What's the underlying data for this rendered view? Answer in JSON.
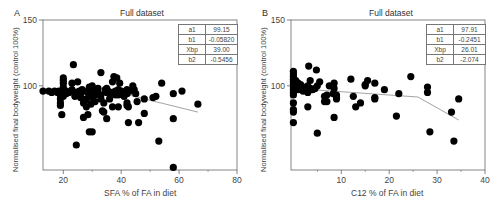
{
  "chart_data": [
    {
      "panel_label": "A",
      "type": "scatter",
      "title": "Full dataset",
      "xlabel": "SFA % of FA in diet",
      "ylabel": "Normalised final bodyweight (control 100%)",
      "xlim": [
        13,
        80
      ],
      "ylim": [
        36,
        150
      ],
      "xticks": [
        20,
        40,
        60,
        80
      ],
      "yticks": [
        100,
        150
      ],
      "grid": false,
      "legend": "none",
      "fit_params": [
        {
          "name": "a1",
          "value": "99.15"
        },
        {
          "name": "b1",
          "value": "-0.05820"
        },
        {
          "name": "Xbp",
          "value": "39.00"
        },
        {
          "name": "b2",
          "value": "-0.5456"
        }
      ],
      "fit_line": {
        "x": [
          13,
          39,
          66.5
        ],
        "y": [
          96.5,
          95,
          80
        ]
      },
      "points": [
        [
          13,
          96
        ],
        [
          15,
          96
        ],
        [
          16,
          95
        ],
        [
          17,
          96
        ],
        [
          18,
          95
        ],
        [
          18.5,
          96
        ],
        [
          19,
          93
        ],
        [
          19,
          90
        ],
        [
          19,
          87
        ],
        [
          19,
          85
        ],
        [
          19.5,
          78
        ],
        [
          19.5,
          95
        ],
        [
          20,
          97
        ],
        [
          20,
          99
        ],
        [
          20,
          102
        ],
        [
          20,
          104
        ],
        [
          20,
          106
        ],
        [
          20,
          96
        ],
        [
          20,
          92
        ],
        [
          20.5,
          94
        ],
        [
          21,
          96
        ],
        [
          21,
          94
        ],
        [
          22,
          95
        ],
        [
          23,
          97
        ],
        [
          23,
          102
        ],
        [
          23.5,
          116
        ],
        [
          24,
          95
        ],
        [
          24,
          92
        ],
        [
          24.5,
          55
        ],
        [
          25,
          95
        ],
        [
          25,
          103
        ],
        [
          25.5,
          96
        ],
        [
          26,
          94
        ],
        [
          26,
          91
        ],
        [
          26.5,
          97
        ],
        [
          27,
          96
        ],
        [
          27,
          87
        ],
        [
          27.5,
          89
        ],
        [
          28,
          90
        ],
        [
          27,
          76
        ],
        [
          28,
          84
        ],
        [
          28.5,
          78
        ],
        [
          28.5,
          95
        ],
        [
          29,
          99
        ],
        [
          29,
          93
        ],
        [
          29,
          65
        ],
        [
          29.5,
          86
        ],
        [
          30,
          100
        ],
        [
          30,
          96
        ],
        [
          30,
          91
        ],
        [
          30,
          65
        ],
        [
          30.5,
          95
        ],
        [
          31,
          96
        ],
        [
          31,
          93
        ],
        [
          31,
          88
        ],
        [
          32,
          98
        ],
        [
          32,
          95
        ],
        [
          33,
          110
        ],
        [
          33,
          93
        ],
        [
          33,
          90
        ],
        [
          33.5,
          81
        ],
        [
          34,
          87
        ],
        [
          34,
          80
        ],
        [
          34.5,
          97
        ],
        [
          35,
          95
        ],
        [
          35,
          98
        ],
        [
          35,
          75
        ],
        [
          35.5,
          96
        ],
        [
          36,
          94
        ],
        [
          36,
          90
        ],
        [
          37,
          84
        ],
        [
          37,
          103
        ],
        [
          37.5,
          107
        ],
        [
          37,
          95
        ],
        [
          38,
          96
        ],
        [
          38,
          93
        ],
        [
          38.5,
          106
        ],
        [
          39,
          97
        ],
        [
          39,
          93
        ],
        [
          39,
          84
        ],
        [
          39.5,
          102
        ],
        [
          40,
          96
        ],
        [
          40,
          94
        ],
        [
          41,
          95
        ],
        [
          41,
          92
        ],
        [
          42,
          97
        ],
        [
          42,
          94
        ],
        [
          42,
          87
        ],
        [
          42,
          85
        ],
        [
          42.5,
          84
        ],
        [
          42.5,
          72
        ],
        [
          43,
          96
        ],
        [
          44,
          100
        ],
        [
          44.5,
          97
        ],
        [
          45,
          94
        ],
        [
          45.5,
          88
        ],
        [
          46,
          72
        ],
        [
          48,
          90
        ],
        [
          48,
          79
        ],
        [
          51,
          91
        ],
        [
          52,
          92
        ],
        [
          53,
          58
        ],
        [
          54,
          102
        ],
        [
          58,
          94
        ],
        [
          58,
          75
        ],
        [
          58,
          38
        ],
        [
          61,
          96
        ],
        [
          66.5,
          86
        ]
      ]
    },
    {
      "panel_label": "B",
      "type": "scatter",
      "title": "Full dataset",
      "xlabel": "C12 % of FA in diet",
      "ylabel": "Normalised final bodyweight (control 100%)",
      "xlim": [
        -0.5,
        40
      ],
      "ylim": [
        36,
        150
      ],
      "xticks": [
        10,
        20,
        30,
        40
      ],
      "yticks": [
        100,
        150
      ],
      "grid": false,
      "legend": "none",
      "fit_params": [
        {
          "name": "a1",
          "value": "97.91"
        },
        {
          "name": "b1",
          "value": "-0.2451"
        },
        {
          "name": "Xbp",
          "value": "26.01"
        },
        {
          "name": "b2",
          "value": "-2.074"
        }
      ],
      "fit_line": {
        "x": [
          0,
          26,
          34.5
        ],
        "y": [
          98,
          91.5,
          74
        ]
      },
      "points": [
        [
          0,
          111
        ],
        [
          0,
          109
        ],
        [
          0,
          107
        ],
        [
          0,
          105
        ],
        [
          0,
          103
        ],
        [
          0,
          101
        ],
        [
          0,
          99
        ],
        [
          0,
          97
        ],
        [
          0,
          95
        ],
        [
          0,
          93
        ],
        [
          0,
          87
        ],
        [
          0,
          82
        ],
        [
          0,
          80
        ],
        [
          0,
          72
        ],
        [
          0.5,
          104
        ],
        [
          0.5,
          98
        ],
        [
          1,
          102
        ],
        [
          1,
          100
        ],
        [
          1,
          97
        ],
        [
          1.5,
          101
        ],
        [
          2,
          99
        ],
        [
          2,
          96
        ],
        [
          2.5,
          98
        ],
        [
          3,
          100
        ],
        [
          3,
          95
        ],
        [
          3,
          84
        ],
        [
          3.2,
          115
        ],
        [
          3.5,
          104
        ],
        [
          3.5,
          98
        ],
        [
          4,
          97
        ],
        [
          4.5,
          98
        ],
        [
          4.8,
          112
        ],
        [
          5,
          100
        ],
        [
          5,
          64
        ],
        [
          5.5,
          103
        ],
        [
          6.5,
          92
        ],
        [
          6.5,
          88
        ],
        [
          7,
          88
        ],
        [
          7,
          93
        ],
        [
          7.5,
          100
        ],
        [
          8.5,
          102
        ],
        [
          8.5,
          98
        ],
        [
          8.3,
          94
        ],
        [
          8.5,
          76
        ],
        [
          9,
          91
        ],
        [
          9,
          93
        ],
        [
          9,
          90
        ],
        [
          12,
          105
        ],
        [
          12.5,
          92
        ],
        [
          13,
          84
        ],
        [
          14,
          87
        ],
        [
          15,
          100
        ],
        [
          15,
          101
        ],
        [
          15.5,
          104
        ],
        [
          17,
          102
        ],
        [
          17,
          90
        ],
        [
          17,
          91
        ],
        [
          19,
          97
        ],
        [
          21.5,
          77
        ],
        [
          22,
          94
        ],
        [
          24.5,
          107
        ],
        [
          28,
          95
        ],
        [
          28,
          99
        ],
        [
          28.5,
          65
        ],
        [
          33,
          80
        ],
        [
          33.5,
          58
        ],
        [
          34.5,
          90
        ]
      ]
    }
  ]
}
